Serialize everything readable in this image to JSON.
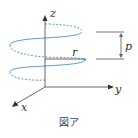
{
  "figure": {
    "caption": "図ア",
    "labels": {
      "z_axis": "z",
      "y_axis": "y",
      "x_axis": "x",
      "radius": "r",
      "pitch": "p"
    },
    "colors": {
      "axis": "#555555",
      "helix": "#4a8fc9",
      "bracket": "#666666"
    }
  }
}
